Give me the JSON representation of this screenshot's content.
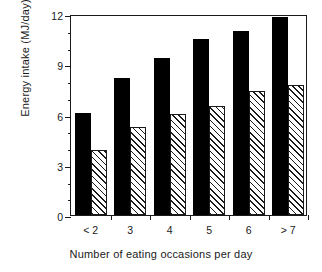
{
  "chart_data": {
    "type": "bar",
    "title": "",
    "xlabel": "Number of eating occasions per day",
    "ylabel": "Energy intake (MJ/day)",
    "categories": [
      "< 2",
      "3",
      "4",
      "5",
      "6",
      "> 7"
    ],
    "series": [
      {
        "name": "solid-series",
        "style": "solid-black",
        "values": [
          6.1,
          8.2,
          9.4,
          10.5,
          11.0,
          11.8
        ]
      },
      {
        "name": "hatched-series",
        "style": "diagonal-hatch",
        "values": [
          3.9,
          5.25,
          6.05,
          6.5,
          7.4,
          7.75
        ]
      }
    ],
    "ylim": [
      0,
      12
    ],
    "ytick_labels": [
      "0",
      "3",
      "6",
      "9",
      "12"
    ],
    "ytick_values": [
      0,
      3,
      6,
      9,
      12
    ],
    "yminor_values": [
      1,
      2,
      4,
      5,
      7,
      8,
      10,
      11
    ],
    "grid": false,
    "legend": "none",
    "colors": {
      "series_solid": "#000000",
      "series_hatched": "#ffffff",
      "axis": "#1a1a1a",
      "background": "#ffffff"
    }
  }
}
